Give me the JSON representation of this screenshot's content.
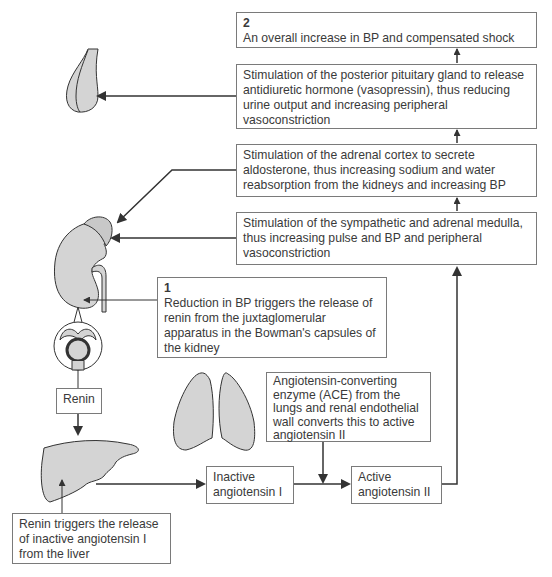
{
  "diagram": {
    "boxes": {
      "outcome": {
        "number": "2",
        "text": "An overall increase in BP and compensated shock"
      },
      "pituitary": {
        "text": "Stimulation of the posterior pituitary gland to release antidiuretic hormone (vasopressin), thus reducing urine output and increasing peripheral vasoconstriction"
      },
      "adrenal_cortex": {
        "text": "Stimulation of the adrenal cortex to secrete aldosterone, thus increasing sodium and water reabsorption from the kidneys and increasing BP"
      },
      "sympathetic": {
        "text": "Stimulation of the sympathetic and adrenal medulla, thus increasing pulse and BP and peripheral vasoconstriction"
      },
      "trigger": {
        "number": "1",
        "text": "Reduction in BP triggers the release of renin from the juxtaglomerular apparatus in the Bowman's capsules of the kidney"
      },
      "renin": {
        "text": "Renin"
      },
      "ace": {
        "text": "Angiotensin-converting enzyme (ACE) from the lungs and renal endothelial wall converts this to active angiotensin II"
      },
      "inactive": {
        "text": "Inactive angiotensin I"
      },
      "active": {
        "text": "Active angiotensin II"
      },
      "liver_release": {
        "text": "Renin triggers the release of inactive angiotensin I from the liver"
      }
    },
    "organs": [
      "pituitary-gland",
      "kidney-with-adrenal",
      "glomerulus",
      "liver",
      "lungs"
    ],
    "colors": {
      "organ_fill": "#d4d4d4",
      "stroke": "#3a3a3a",
      "box_border": "#7a7a7a"
    }
  }
}
